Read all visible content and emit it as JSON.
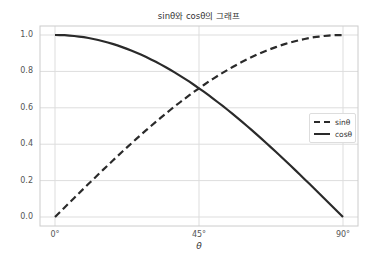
{
  "chart_data": {
    "type": "line",
    "title": "sinθ와 cosθ의 그래프",
    "xlabel": "θ",
    "ylabel": "",
    "x": [
      0,
      9,
      18,
      27,
      36,
      45,
      54,
      63,
      72,
      81,
      90
    ],
    "series": [
      {
        "name": "sinθ",
        "style": "dashed",
        "color": "#2a2a2a",
        "values": [
          0.0,
          0.156,
          0.309,
          0.454,
          0.588,
          0.707,
          0.809,
          0.891,
          0.951,
          0.988,
          1.0
        ]
      },
      {
        "name": "cosθ",
        "style": "solid",
        "color": "#2a2a2a",
        "values": [
          1.0,
          0.988,
          0.951,
          0.891,
          0.809,
          0.707,
          0.588,
          0.454,
          0.309,
          0.156,
          0.0
        ]
      }
    ],
    "xticks": [
      0,
      45,
      90
    ],
    "xtick_labels": [
      "0°",
      "45°",
      "90°"
    ],
    "yticks": [
      0.0,
      0.2,
      0.4,
      0.6,
      0.8,
      1.0
    ],
    "ytick_labels": [
      "0.0",
      "0.2",
      "0.4",
      "0.6",
      "0.8",
      "1.0"
    ],
    "xlim": [
      -4.7,
      94.7
    ],
    "ylim": [
      -0.05,
      1.05
    ],
    "grid": true,
    "legend_position": "center right"
  },
  "legend": {
    "sin_label": "sinθ",
    "cos_label": "cosθ"
  }
}
